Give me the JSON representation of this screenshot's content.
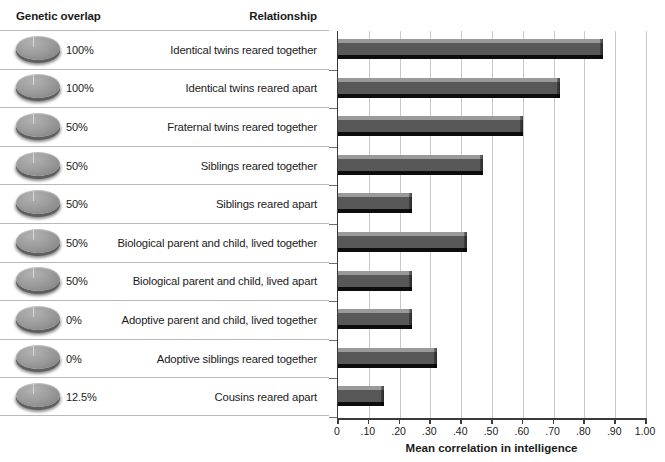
{
  "table": {
    "headers": {
      "genetic_overlap": "Genetic overlap",
      "relationship": "Relationship"
    },
    "rows": [
      {
        "genetic_overlap": "100%",
        "relationship": "Identical twins reared together",
        "correlation": 0.86
      },
      {
        "genetic_overlap": "100%",
        "relationship": "Identical twins reared apart",
        "correlation": 0.72
      },
      {
        "genetic_overlap": "50%",
        "relationship": "Fraternal twins reared together",
        "correlation": 0.6
      },
      {
        "genetic_overlap": "50%",
        "relationship": "Siblings reared together",
        "correlation": 0.47
      },
      {
        "genetic_overlap": "50%",
        "relationship": "Siblings reared apart",
        "correlation": 0.24
      },
      {
        "genetic_overlap": "50%",
        "relationship": "Biological parent and child, lived together",
        "correlation": 0.42
      },
      {
        "genetic_overlap": "50%",
        "relationship": "Biological parent and child, lived apart",
        "correlation": 0.24
      },
      {
        "genetic_overlap": "0%",
        "relationship": "Adoptive parent and child, lived together",
        "correlation": 0.24
      },
      {
        "genetic_overlap": "0%",
        "relationship": "Adoptive siblings reared together",
        "correlation": 0.32
      },
      {
        "genetic_overlap": "12.5%",
        "relationship": "Cousins reared apart",
        "correlation": 0.15
      }
    ]
  },
  "axis": {
    "title": "Mean correlation in intelligence",
    "tick_labels": [
      "0",
      ".10",
      ".20",
      ".30",
      ".40",
      ".50",
      ".60",
      ".70",
      ".80",
      ".90",
      "1.00"
    ],
    "tick_values": [
      0,
      0.1,
      0.2,
      0.3,
      0.4,
      0.5,
      0.6,
      0.7,
      0.8,
      0.9,
      1.0
    ]
  },
  "colors": {
    "bar_face": "#585858",
    "bar_top": "#9a9a9a",
    "bar_bottom": "#0d0d0d",
    "grid": "#c9c9c9",
    "axis": "#3a3a3a",
    "text": "#1b1b1b",
    "row_divider": "#b9b9b9",
    "disc": "#9d9d9d",
    "background": "#ffffff"
  },
  "chart_data": {
    "type": "bar",
    "orientation": "horizontal",
    "title": "",
    "subtitle": "",
    "xlabel": "Mean correlation in intelligence",
    "ylabel": "",
    "xlim": [
      0,
      1.0
    ],
    "grid": true,
    "legend": "none",
    "categories": [
      "Identical twins reared together",
      "Identical twins reared apart",
      "Fraternal twins reared together",
      "Siblings reared together",
      "Siblings reared apart",
      "Biological parent and child, lived together",
      "Biological parent and child, lived apart",
      "Adoptive parent and child, lived together",
      "Adoptive siblings reared together",
      "Cousins reared apart"
    ],
    "values": [
      0.86,
      0.72,
      0.6,
      0.47,
      0.24,
      0.42,
      0.24,
      0.24,
      0.32,
      0.15
    ],
    "genetic_overlap": [
      "100%",
      "100%",
      "50%",
      "50%",
      "50%",
      "50%",
      "50%",
      "0%",
      "0%",
      "12.5%"
    ],
    "xtick_labels": [
      "0",
      ".10",
      ".20",
      ".30",
      ".40",
      ".50",
      ".60",
      ".70",
      ".80",
      ".90",
      "1.00"
    ],
    "xticks": [
      0,
      0.1,
      0.2,
      0.3,
      0.4,
      0.5,
      0.6,
      0.7,
      0.8,
      0.9,
      1.0
    ]
  }
}
